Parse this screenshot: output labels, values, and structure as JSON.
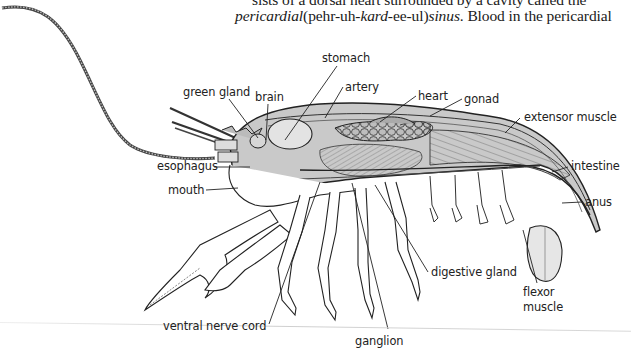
{
  "text": {
    "line1": "sists of a dorsal heart surrounded by a cavity called the",
    "line2_italic1": "pericardial",
    "line2_plain1": "(pehr-uh-",
    "line2_italic2": "kard",
    "line2_plain2": "-ee-ul)",
    "line2_italic3": "sinus",
    "line2_plain3": ". Blood in the pericardial"
  },
  "figure": {
    "labels": [
      {
        "id": "stomach",
        "text": "stomach",
        "x": 322,
        "y": 52
      },
      {
        "id": "artery",
        "text": "artery",
        "x": 345,
        "y": 81
      },
      {
        "id": "green-gland",
        "text": "green gland",
        "x": 183,
        "y": 86
      },
      {
        "id": "brain",
        "text": "brain",
        "x": 255,
        "y": 91
      },
      {
        "id": "heart",
        "text": "heart",
        "x": 418,
        "y": 90
      },
      {
        "id": "gonad",
        "text": "gonad",
        "x": 464,
        "y": 93
      },
      {
        "id": "extensor-muscle",
        "text": "extensor muscle",
        "x": 524,
        "y": 111
      },
      {
        "id": "intestine",
        "text": "intestine",
        "x": 571,
        "y": 160
      },
      {
        "id": "esophagus",
        "text": "esophagus",
        "x": 157,
        "y": 160
      },
      {
        "id": "mouth",
        "text": "mouth",
        "x": 168,
        "y": 184
      },
      {
        "id": "anus",
        "text": "anus",
        "x": 585,
        "y": 196
      },
      {
        "id": "digestive-gland",
        "text": "digestive gland",
        "x": 431,
        "y": 266
      },
      {
        "id": "flexor",
        "text": "flexor",
        "x": 523,
        "y": 286
      },
      {
        "id": "muscle",
        "text": "muscle",
        "x": 523,
        "y": 301
      },
      {
        "id": "ventral-nerve-cord",
        "text": "ventral nerve cord",
        "x": 163,
        "y": 320
      },
      {
        "id": "ganglion",
        "text": "ganglion",
        "x": 355,
        "y": 335
      }
    ]
  }
}
